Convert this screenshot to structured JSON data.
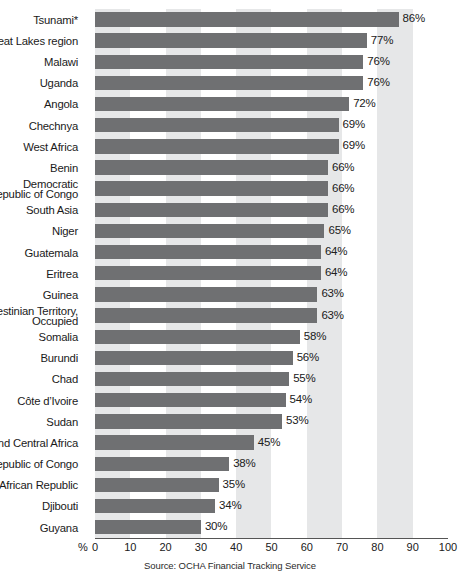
{
  "chart_data": {
    "type": "bar",
    "orientation": "horizontal",
    "title": "",
    "subtitle": "",
    "xlabel": "%",
    "ylabel": "",
    "xlim": [
      0,
      100
    ],
    "xticks": [
      0,
      10,
      20,
      30,
      40,
      50,
      60,
      70,
      80,
      90,
      100
    ],
    "xtick_labels": [
      "0",
      "10",
      "20",
      "30",
      "40",
      "50",
      "60",
      "70",
      "80",
      "90",
      "100"
    ],
    "grid": "alternating vertical shaded bands every 10 units",
    "legend": "none",
    "value_label_suffix": "%",
    "categories": [
      "Tsunami*",
      "Great Lakes region",
      "Malawi",
      "Uganda",
      "Angola",
      "Chechnya",
      "West Africa",
      "Benin",
      "Democratic\nRepublic of Congo",
      "South Asia",
      "Niger",
      "Guatemala",
      "Eritrea",
      "Guinea",
      "Palestinian Territory,\nOccupied",
      "Somalia",
      "Burundi",
      "Chad",
      "Côte d’Ivoire",
      "Sudan",
      "West and Central Africa",
      "Republic of Congo",
      "Central African Republic",
      "Djibouti",
      "Guyana"
    ],
    "values": [
      86,
      77,
      76,
      76,
      72,
      69,
      69,
      66,
      66,
      66,
      65,
      64,
      64,
      63,
      63,
      58,
      56,
      55,
      54,
      53,
      45,
      38,
      35,
      34,
      30
    ],
    "value_labels": [
      "86%",
      "77%",
      "76%",
      "76%",
      "72%",
      "69%",
      "69%",
      "66%",
      "66%",
      "66%",
      "65%",
      "64%",
      "64%",
      "63%",
      "63%",
      "58%",
      "56%",
      "55%",
      "54%",
      "53%",
      "45%",
      "38%",
      "35%",
      "34%",
      "30%"
    ],
    "bar_color": "#6f7072",
    "band_color": "#e6e7e8",
    "background_color": "#ffffff",
    "source": "Source: OCHA Financial Tracking Service"
  },
  "axis": {
    "unit_label": "%"
  },
  "footer": {
    "source": "Source: OCHA Financial Tracking Service"
  }
}
